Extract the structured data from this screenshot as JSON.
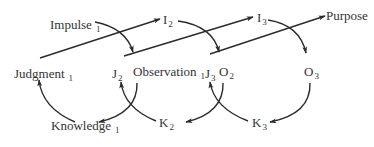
{
  "diagram": {
    "type": "cyclic-process",
    "stroke_color": "#2b2b2b",
    "text_color": "#333333",
    "nodes": {
      "impulse1": {
        "base": "Impulse",
        "sub": "1"
      },
      "i2": {
        "base": "I",
        "sub": "2"
      },
      "i3": {
        "base": "I",
        "sub": "3"
      },
      "purpose": {
        "base": "Purpose",
        "sub": ""
      },
      "judgment1": {
        "base": "Judgment",
        "sub": "1"
      },
      "j2": {
        "base": "J",
        "sub": "2"
      },
      "observation1": {
        "base": "Observation",
        "sub": "1"
      },
      "j3": {
        "base": "J",
        "sub": "3"
      },
      "o2": {
        "base": "O",
        "sub": "2"
      },
      "o3": {
        "base": "O",
        "sub": "3"
      },
      "knowledge1": {
        "base": "Knowledge",
        "sub": "1"
      },
      "k2": {
        "base": "K",
        "sub": "2"
      },
      "k3": {
        "base": "K",
        "sub": "3"
      }
    },
    "edges": [
      {
        "from": "Impulse 1",
        "to": "Observation 1",
        "shape": "curve"
      },
      {
        "from": "Judgment 1",
        "to": "I 2",
        "shape": "straight"
      },
      {
        "from": "I 2",
        "to": "O 2",
        "shape": "curve"
      },
      {
        "from": "J 2",
        "to": "I 3",
        "shape": "straight"
      },
      {
        "from": "I 3",
        "to": "O 3",
        "shape": "curve"
      },
      {
        "from": "J 3",
        "to": "Purpose",
        "shape": "straight"
      },
      {
        "from": "Observation 1",
        "to": "Knowledge 1",
        "shape": "curve"
      },
      {
        "from": "Knowledge 1",
        "to": "Judgment 1",
        "shape": "curve"
      },
      {
        "from": "K 2",
        "to": "J 2",
        "shape": "curve"
      },
      {
        "from": "O 2",
        "to": "K 2",
        "shape": "curve"
      },
      {
        "from": "K 3",
        "to": "J 3",
        "shape": "curve"
      },
      {
        "from": "O 3",
        "to": "K 3",
        "shape": "curve"
      }
    ]
  }
}
